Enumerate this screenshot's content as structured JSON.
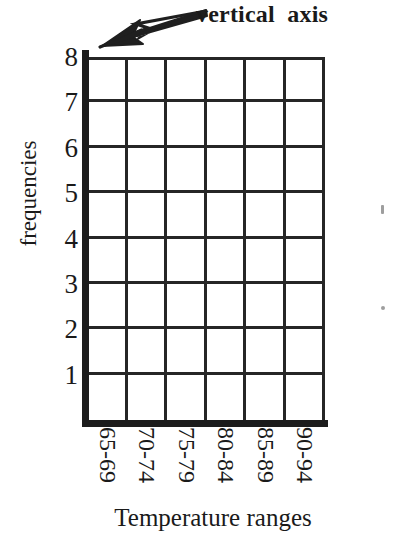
{
  "figure": {
    "annotation": {
      "text": "vertical  axis",
      "arrow_name": "annotation-arrow"
    },
    "x_axis_title": "Temperature ranges",
    "y_axis_title": "frequencies"
  },
  "chart_data": {
    "type": "bar",
    "title": "",
    "subtitle": "",
    "xlabel": "Temperature ranges",
    "ylabel": "frequencies",
    "categories": [
      "65-69",
      "70-74",
      "75-79",
      "80-84",
      "85-89",
      "90-94"
    ],
    "values": [
      0,
      0,
      0,
      0,
      0,
      0
    ],
    "ytick_labels": [
      "8",
      "7",
      "6",
      "5",
      "4",
      "3",
      "2",
      "1"
    ],
    "yticks": [
      8,
      7,
      6,
      5,
      4,
      3,
      2,
      1
    ],
    "ylim": [
      0,
      8
    ],
    "grid": true,
    "legend": "none",
    "annotations": [
      {
        "text": "vertical  axis",
        "points_to": "y-axis",
        "style": "bold-serif-with-arrow"
      }
    ],
    "note": "Empty grid template — axes and gridlines drawn, no bars plotted"
  },
  "colors": {
    "ink": "#1a1a1a",
    "gridline": "#262626",
    "axis": "#1c1c1c",
    "background": "#ffffff"
  }
}
